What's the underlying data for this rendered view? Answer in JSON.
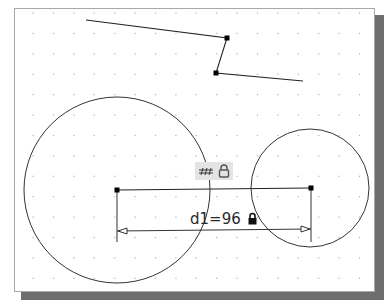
{
  "canvas": {
    "background": "#ffffff",
    "border_color": "#a8a8a8",
    "shadow_color": "#6e6e6e",
    "grid": {
      "style": "dot",
      "color": "#b0b0b0",
      "origin": [
        33,
        13
      ],
      "spacing": 20.4,
      "cols": 17,
      "rows": 14
    }
  },
  "geometry": {
    "polyline": [
      [
        86,
        20
      ],
      [
        227,
        38
      ],
      [
        216,
        73
      ],
      [
        303,
        81
      ]
    ],
    "polyline_vertices": [
      [
        227,
        38
      ],
      [
        216,
        73
      ]
    ],
    "circles": [
      {
        "name": "left-circle",
        "cx": 117,
        "cy": 190,
        "r": 93
      },
      {
        "name": "right-circle",
        "cx": 310,
        "cy": 188,
        "r": 59
      }
    ],
    "center_line": {
      "x1": 117,
      "y1": 190,
      "x2": 311,
      "y2": 188
    },
    "center_points": [
      [
        117,
        190
      ],
      [
        311,
        188
      ]
    ]
  },
  "constraint_badge": {
    "icons": [
      "horizontal-constraint-icon",
      "lock-icon"
    ]
  },
  "dimension": {
    "label": "d1=96",
    "name": "d1",
    "value": 96,
    "locked": true,
    "line_y_left": 231,
    "line_y_right": 229,
    "extension_bottom": 242
  }
}
